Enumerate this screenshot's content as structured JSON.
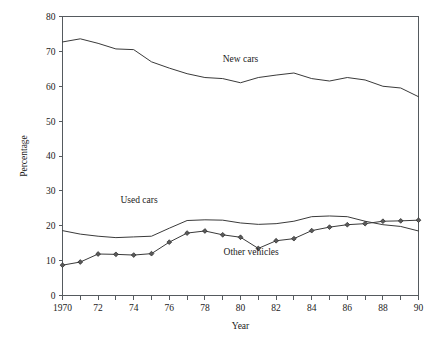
{
  "chart_data": {
    "type": "line",
    "title": "",
    "xlabel": "Year",
    "ylabel": "Percentage",
    "xlim": [
      1970,
      1990
    ],
    "ylim": [
      0,
      80
    ],
    "grid": false,
    "legend_position": "inline-annotations",
    "x": [
      1970,
      1971,
      1972,
      1973,
      1974,
      1975,
      1976,
      1977,
      1978,
      1979,
      1980,
      1981,
      1982,
      1983,
      1984,
      1985,
      1986,
      1987,
      1988,
      1989,
      1990
    ],
    "y_ticks": [
      0,
      10,
      20,
      30,
      40,
      50,
      60,
      70,
      80
    ],
    "y_tick_labels": [
      "0",
      "10",
      "20",
      "30",
      "40",
      "50",
      "60",
      "70",
      "80"
    ],
    "x_ticks": [
      1970,
      1971,
      1972,
      1973,
      1974,
      1975,
      1976,
      1977,
      1978,
      1979,
      1980,
      1981,
      1982,
      1983,
      1984,
      1985,
      1986,
      1987,
      1988,
      1989,
      1990
    ],
    "x_tick_labels": [
      "1970",
      "",
      "72",
      "",
      "74",
      "",
      "76",
      "",
      "78",
      "",
      "80",
      "",
      "82",
      "",
      "84",
      "",
      "86",
      "",
      "88",
      "",
      "90"
    ],
    "series": [
      {
        "name": "New cars",
        "markers": false,
        "label_x": 1980,
        "label_y": 67,
        "values": [
          72.7,
          73.6,
          72.3,
          70.7,
          70.5,
          67.0,
          65.2,
          63.6,
          62.5,
          62.2,
          61.0,
          62.5,
          63.2,
          63.8,
          62.2,
          61.5,
          62.5,
          61.8,
          60.0,
          59.5,
          57.0
        ]
      },
      {
        "name": "Used cars",
        "markers": false,
        "label_x": 1974.3,
        "label_y": 26.5,
        "values": [
          18.6,
          17.6,
          17.0,
          16.6,
          16.8,
          17.0,
          19.3,
          21.5,
          21.7,
          21.6,
          20.8,
          20.4,
          20.6,
          21.3,
          22.6,
          22.8,
          22.6,
          21.3,
          20.3,
          19.8,
          18.5
        ]
      },
      {
        "name": "Other vehicles",
        "markers": true,
        "label_x": 1980.6,
        "label_y": 11.5,
        "values": [
          8.7,
          9.6,
          11.9,
          11.8,
          11.6,
          12.0,
          15.3,
          17.9,
          18.5,
          17.4,
          16.7,
          13.5,
          15.7,
          16.3,
          18.6,
          19.6,
          20.3,
          20.6,
          21.3,
          21.4,
          21.6
        ]
      }
    ]
  },
  "ui": {
    "figure_name": "percentage-by-year-line-chart"
  }
}
